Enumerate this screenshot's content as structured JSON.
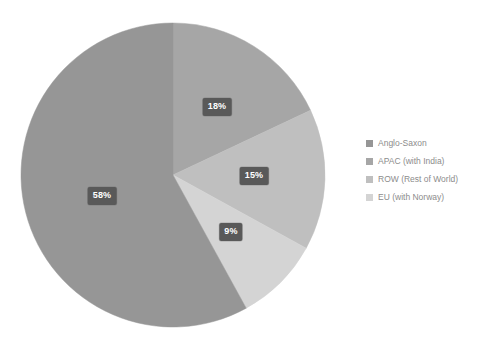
{
  "chart_data": {
    "type": "pie",
    "title": "",
    "subtitle": "",
    "xlabel": "",
    "ylabel": "",
    "grid": false,
    "legend_position": "right",
    "start_angle_deg": 0,
    "direction": "clockwise",
    "units": "percent",
    "categories": [
      "Anglo-Saxon",
      "APAC (with India)",
      "ROW (Rest of World)",
      "EU (with Norway)"
    ],
    "values": [
      58,
      18,
      15,
      9
    ],
    "data_labels": [
      "58%",
      "18%",
      "15%",
      "9%"
    ],
    "colors": [
      "#969696",
      "#a6a6a6",
      "#bfbfbf",
      "#d4d4d4"
    ],
    "slices": [
      {
        "label": "APAC (with India)",
        "value": 18,
        "data_label": "18%",
        "color": "#a6a6a6",
        "start_deg": 0,
        "end_deg": 64.8,
        "label_x": 217,
        "label_y": 107
      },
      {
        "label": "ROW (Rest of World)",
        "value": 15,
        "data_label": "15%",
        "color": "#bfbfbf",
        "start_deg": 64.8,
        "end_deg": 118.8,
        "label_x": 254,
        "label_y": 176
      },
      {
        "label": "EU (with Norway)",
        "value": 9,
        "data_label": "9%",
        "color": "#d4d4d4",
        "start_deg": 118.8,
        "end_deg": 151.2,
        "label_x": 231,
        "label_y": 232
      },
      {
        "label": "Anglo-Saxon",
        "value": 58,
        "data_label": "58%",
        "color": "#969696",
        "start_deg": 151.2,
        "end_deg": 360,
        "label_x": 102,
        "label_y": 196
      }
    ]
  },
  "legend": {
    "items": [
      {
        "label": "Anglo-Saxon",
        "color": "#969696"
      },
      {
        "label": "APAC (with India)",
        "color": "#a6a6a6"
      },
      {
        "label": "ROW (Rest of World)",
        "color": "#bfbfbf"
      },
      {
        "label": "EU (with Norway)",
        "color": "#d4d4d4"
      }
    ]
  },
  "geometry": {
    "center_x": 173,
    "center_y": 175,
    "radius": 152
  },
  "colors": {
    "background": "#ffffff",
    "label_box": "#595959",
    "label_text": "#ffffff",
    "legend_text": "#8c8c8c"
  }
}
